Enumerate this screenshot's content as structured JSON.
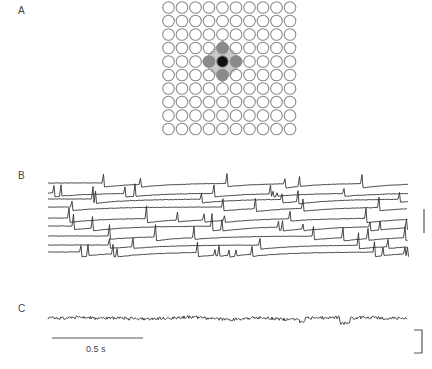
{
  "figure": {
    "panels": {
      "A": {
        "label": "A",
        "grid": {
          "rows": 10,
          "cols": 10,
          "x0": 168.5,
          "y0": 7.5,
          "pitch": 13.5,
          "radius": 5.8
        },
        "center": {
          "row": 4,
          "col": 4,
          "color": "#111111"
        },
        "neighbors": [
          {
            "row": 3,
            "col": 4,
            "color": "#8a8a8a"
          },
          {
            "row": 5,
            "col": 4,
            "color": "#8a8a8a"
          },
          {
            "row": 4,
            "col": 3,
            "color": "#8a8a8a"
          },
          {
            "row": 4,
            "col": 5,
            "color": "#8a8a8a"
          }
        ],
        "highlight_color": "#c9c9c9",
        "outline_color": "#8c8c8c"
      },
      "B": {
        "label": "B",
        "trace_count": 9,
        "x_start": 48,
        "x_end": 408,
        "baselines": [
          183,
          193,
          199,
          207,
          218,
          226,
          236,
          245,
          252
        ],
        "vertical_scale_bar": {
          "x": 424,
          "y1": 209,
          "y2": 233
        }
      },
      "C": {
        "label": "C",
        "x_start": 48,
        "x_end": 408,
        "baseline": 318,
        "time_scale_bar": {
          "x1": 52,
          "x2": 143,
          "y": 338,
          "label": "0.5 s"
        },
        "amplitude_bracket": {
          "x1": 414,
          "x2": 422,
          "y1": 330,
          "y2": 353
        }
      }
    }
  }
}
